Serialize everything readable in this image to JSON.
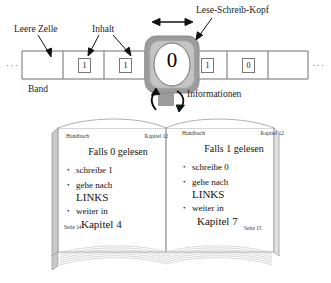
{
  "diagram": {
    "labels": {
      "empty_cell": "Leere Zelle",
      "content": "Inhalt",
      "head": "Lese-Schreib-Kopf",
      "tape": "Band",
      "information": "Informationen"
    },
    "tape": {
      "left_ellipsis": "···",
      "right_ellipsis": "···",
      "cells": [
        {
          "value": "",
          "empty": true
        },
        {
          "value": "1",
          "empty": false
        },
        {
          "value": "1",
          "empty": false
        },
        {
          "value": "0",
          "empty": false,
          "under_head": true
        },
        {
          "value": "1",
          "empty": false
        },
        {
          "value": "0",
          "empty": false
        },
        {
          "value": "",
          "empty": true
        }
      ]
    },
    "head": {
      "current_symbol": "0",
      "move_arrow": "left-right-double-arrow",
      "io_arrows": [
        "read-up-arrow",
        "write-down-arrow"
      ]
    }
  },
  "book": {
    "left_page": {
      "header_left": "Handbuch",
      "header_right": "Kapitel 12",
      "title": "Falls 0 gelesen",
      "items": [
        {
          "line1": "schreibe 1",
          "line2": ""
        },
        {
          "line1": "gehe nach",
          "line2": "LINKS"
        },
        {
          "line1": "weiter in",
          "line2": "Kapitel 4"
        }
      ],
      "page_number": "Seite 14"
    },
    "right_page": {
      "header_left": "Handbuch",
      "header_right": "Kapitel 12",
      "title": "Falls 1 gelesen",
      "items": [
        {
          "line1": "schreibe 0",
          "line2": ""
        },
        {
          "line1": "gehe nach",
          "line2": "LINKS"
        },
        {
          "line1": "weiter in",
          "line2": "Kapitel 7"
        }
      ],
      "page_number": "Seite 15"
    }
  },
  "colors": {
    "head_body": "#9c9c9c",
    "head_inner": "#c8c8c8",
    "line": "#6f6f6f",
    "text": "#1a1a1a",
    "page_edge": "#b9b9b9"
  }
}
